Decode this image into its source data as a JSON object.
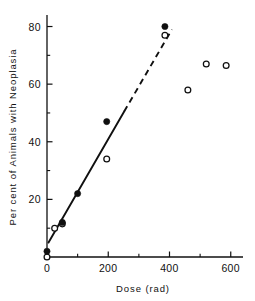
{
  "chart_data": {
    "type": "scatter",
    "title": "",
    "xlabel": "Dose (rad)",
    "ylabel": "Per cent of Animals with Neoplasia",
    "xlim": [
      0,
      640
    ],
    "ylim": [
      0,
      84
    ],
    "grid": false,
    "legend": "none",
    "xticks": [
      0,
      200,
      400,
      600
    ],
    "xtick_labels": [
      "0",
      "200",
      "400",
      "600"
    ],
    "xminor_ticks": [
      100,
      300,
      500
    ],
    "yticks": [
      0,
      20,
      40,
      60,
      80
    ],
    "ytick_labels": [
      "0",
      "20",
      "40",
      "60",
      "80"
    ],
    "yminor_ticks": [
      10,
      30,
      50,
      70
    ],
    "series": [
      {
        "name": "filled-circles",
        "marker": "filled-circle",
        "color": "#101010",
        "points": [
          {
            "x": 0,
            "y": 2
          },
          {
            "x": 50,
            "y": 12
          },
          {
            "x": 100,
            "y": 22
          },
          {
            "x": 195,
            "y": 47
          },
          {
            "x": 385,
            "y": 80
          }
        ]
      },
      {
        "name": "open-circles",
        "marker": "open-circle",
        "color": "#101010",
        "points": [
          {
            "x": 0,
            "y": 0
          },
          {
            "x": 25,
            "y": 10
          },
          {
            "x": 50,
            "y": 11.5
          },
          {
            "x": 195,
            "y": 34
          },
          {
            "x": 385,
            "y": 77
          },
          {
            "x": 460,
            "y": 58
          },
          {
            "x": 520,
            "y": 67
          },
          {
            "x": 585,
            "y": 66.5
          }
        ]
      }
    ],
    "fit_line": {
      "name": "linear-fit",
      "solid_segment": {
        "x0": 5,
        "y0": 5,
        "x1": 252,
        "y1": 50.5
      },
      "dashed_segment": {
        "x0": 252,
        "y0": 50.5,
        "x1": 408,
        "y1": 79
      },
      "color": "#101010"
    }
  },
  "axes": {
    "x_label": "Dose (rad)",
    "y_label": "Per cent of Animals with Neoplasia"
  },
  "colors": {
    "ink": "#101010",
    "background": "#ffffff"
  }
}
